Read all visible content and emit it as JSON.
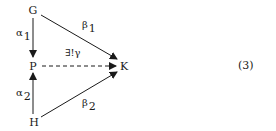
{
  "diagram": {
    "nodes": {
      "G": "G",
      "P": "P",
      "H": "H",
      "K": "K"
    },
    "edges": {
      "alpha1": {
        "sym": "α",
        "sub": "1",
        "from": "G",
        "to": "P",
        "style": "solid"
      },
      "alpha2": {
        "sym": "α",
        "sub": "2",
        "from": "H",
        "to": "P",
        "style": "solid"
      },
      "beta1": {
        "sym": "β",
        "sub": "1",
        "from": "G",
        "to": "K",
        "style": "solid"
      },
      "beta2": {
        "sym": "β",
        "sub": "2",
        "from": "H",
        "to": "K",
        "style": "solid"
      },
      "gamma": {
        "label": "∃!γ",
        "from": "P",
        "to": "K",
        "style": "dashed"
      }
    },
    "equation_number": "(3)",
    "stroke_color": "#1a1a1a"
  }
}
